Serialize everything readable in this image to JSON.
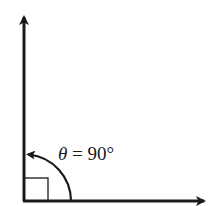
{
  "diagram": {
    "type": "right-angle",
    "label": {
      "symbol": "θ",
      "equals": " = ",
      "value": "90°"
    },
    "colors": {
      "stroke": "#1a1a1a",
      "background": "#ffffff"
    }
  }
}
